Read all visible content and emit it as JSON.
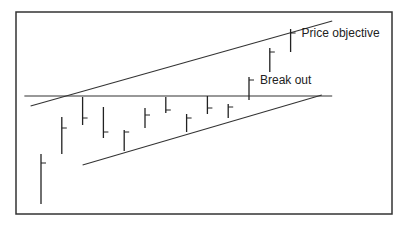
{
  "chart_data": {
    "type": "ohlc",
    "title": "",
    "xlabel": "",
    "ylabel": "",
    "bars": [
      {
        "high": 50,
        "low": 0,
        "close": 41
      },
      {
        "high": 87,
        "low": 50,
        "close": 76
      },
      {
        "high": 107,
        "low": 79,
        "close": 86
      },
      {
        "high": 97,
        "low": 66,
        "close": 72
      },
      {
        "high": 74,
        "low": 53,
        "close": 72
      },
      {
        "high": 96,
        "low": 76,
        "close": 89
      },
      {
        "high": 107,
        "low": 91,
        "close": 94
      },
      {
        "high": 90,
        "low": 72,
        "close": 86
      },
      {
        "high": 108,
        "low": 90,
        "close": 96
      },
      {
        "high": 100,
        "low": 86,
        "close": 97
      },
      {
        "high": 127,
        "low": 104,
        "close": 124
      },
      {
        "high": 156,
        "low": 132,
        "close": 152
      },
      {
        "high": 175,
        "low": 152,
        "close": 171
      }
    ],
    "trendlines": [
      {
        "name": "upper-channel",
        "from": [
          -0.5,
          98
        ],
        "to": [
          14,
          183
        ]
      },
      {
        "name": "resistance",
        "from": [
          -0.8,
          108
        ],
        "to": [
          14,
          108
        ]
      },
      {
        "name": "lower-support",
        "from": [
          2,
          39
        ],
        "to": [
          13.5,
          109
        ]
      }
    ],
    "annotations": [
      {
        "text": "Price objective",
        "bar": 12
      },
      {
        "text": "Break out",
        "bar": 10
      }
    ],
    "ylim": [
      0,
      192
    ]
  }
}
